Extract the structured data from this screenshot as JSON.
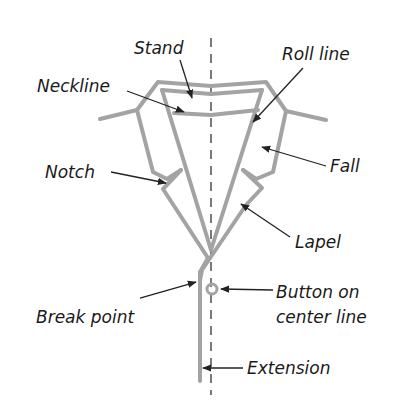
{
  "diagram": {
    "labels": {
      "stand": "Stand",
      "roll_line": "Roll line",
      "neckline": "Neckline",
      "notch": "Notch",
      "fall": "Fall",
      "lapel": "Lapel",
      "break_point": "Break point",
      "button_line1": "Button on",
      "button_line2": "center line",
      "extension": "Extension"
    },
    "colors": {
      "garment_stroke": "#a3a3a3",
      "text": "#1a1a1a",
      "background": "#ffffff"
    }
  }
}
